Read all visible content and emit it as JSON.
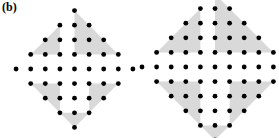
{
  "panel": {
    "label": "(b)",
    "caption_present": true
  },
  "style": {
    "background_color": "#ffffff",
    "dot_color": "#000000",
    "shade_color": "#d9d9d9",
    "dot_radius": 2.4
  },
  "chart_data": {
    "type": "scatter",
    "title": "(b)",
    "xlabel": "",
    "ylabel": "",
    "grid": false,
    "legend": null,
    "figures": [
      {
        "name": "left-diamond",
        "order": 4,
        "center": [
          74.5,
          69
        ],
        "spacing": 14.6,
        "center_row_count": 9,
        "total_dots": 41,
        "points": [
          [
            0,
            4
          ],
          [
            -1,
            3
          ],
          [
            0,
            3
          ],
          [
            1,
            3
          ],
          [
            -2,
            2
          ],
          [
            -1,
            2
          ],
          [
            0,
            2
          ],
          [
            1,
            2
          ],
          [
            2,
            2
          ],
          [
            -3,
            1
          ],
          [
            -2,
            1
          ],
          [
            -1,
            1
          ],
          [
            0,
            1
          ],
          [
            1,
            1
          ],
          [
            2,
            1
          ],
          [
            3,
            1
          ],
          [
            -4,
            0
          ],
          [
            -3,
            0
          ],
          [
            -2,
            0
          ],
          [
            -1,
            0
          ],
          [
            0,
            0
          ],
          [
            1,
            0
          ],
          [
            2,
            0
          ],
          [
            3,
            0
          ],
          [
            4,
            0
          ],
          [
            -3,
            -1
          ],
          [
            -2,
            -1
          ],
          [
            -1,
            -1
          ],
          [
            0,
            -1
          ],
          [
            1,
            -1
          ],
          [
            2,
            -1
          ],
          [
            3,
            -1
          ],
          [
            -2,
            -2
          ],
          [
            -1,
            -2
          ],
          [
            0,
            -2
          ],
          [
            1,
            -2
          ],
          [
            2,
            -2
          ],
          [
            -1,
            -3
          ],
          [
            0,
            -3
          ],
          [
            1,
            -3
          ],
          [
            0,
            -4
          ]
        ],
        "shaded_triangles": [
          {
            "id": "upper-right",
            "vertices": [
              [
                0,
                4
              ],
              [
                0,
                1
              ],
              [
                3,
                1
              ]
            ]
          },
          {
            "id": "upper-left",
            "vertices": [
              [
                -1,
                3
              ],
              [
                -3,
                1
              ],
              [
                -1,
                1
              ]
            ]
          },
          {
            "id": "lower-left",
            "vertices": [
              [
                -3,
                -1
              ],
              [
                -1,
                -1
              ],
              [
                -1,
                -3
              ]
            ]
          },
          {
            "id": "lower-right",
            "vertices": [
              [
                1,
                -1
              ],
              [
                3,
                -1
              ],
              [
                1,
                -3
              ]
            ]
          },
          {
            "id": "bottom-tip",
            "vertices": [
              [
                -1,
                -3
              ],
              [
                1,
                -3
              ],
              [
                0,
                -4
              ]
            ]
          }
        ]
      },
      {
        "name": "right-diamond",
        "order": 5,
        "center": [
          215,
          67
        ],
        "spacing": 14.6,
        "center_row_count": 10,
        "total_dots": 61,
        "points": [
          [
            0,
            5
          ],
          [
            -1,
            4
          ],
          [
            0,
            4
          ],
          [
            1,
            4
          ],
          [
            -2,
            3
          ],
          [
            -1,
            3
          ],
          [
            0,
            3
          ],
          [
            1,
            3
          ],
          [
            2,
            3
          ],
          [
            -3,
            2
          ],
          [
            -2,
            2
          ],
          [
            -1,
            2
          ],
          [
            0,
            2
          ],
          [
            1,
            2
          ],
          [
            2,
            2
          ],
          [
            3,
            2
          ],
          [
            -4,
            1
          ],
          [
            -3,
            1
          ],
          [
            -2,
            1
          ],
          [
            -1,
            1
          ],
          [
            0,
            1
          ],
          [
            1,
            1
          ],
          [
            2,
            1
          ],
          [
            3,
            1
          ],
          [
            4,
            1
          ],
          [
            -5,
            0
          ],
          [
            -4,
            0
          ],
          [
            -3,
            0
          ],
          [
            -2,
            0
          ],
          [
            -1,
            0
          ],
          [
            0,
            0
          ],
          [
            1,
            0
          ],
          [
            2,
            0
          ],
          [
            3,
            0
          ],
          [
            4,
            0
          ],
          [
            5,
            0
          ],
          [
            -4,
            -1
          ],
          [
            -3,
            -1
          ],
          [
            -2,
            -1
          ],
          [
            -1,
            -1
          ],
          [
            0,
            -1
          ],
          [
            1,
            -1
          ],
          [
            2,
            -1
          ],
          [
            3,
            -1
          ],
          [
            4,
            -1
          ],
          [
            -3,
            -2
          ],
          [
            -2,
            -2
          ],
          [
            -1,
            -2
          ],
          [
            0,
            -2
          ],
          [
            1,
            -2
          ],
          [
            2,
            -2
          ],
          [
            3,
            -2
          ],
          [
            -2,
            -3
          ],
          [
            -1,
            -3
          ],
          [
            0,
            -3
          ],
          [
            1,
            -3
          ],
          [
            2,
            -3
          ],
          [
            -1,
            -4
          ],
          [
            0,
            -4
          ],
          [
            1,
            -4
          ],
          [
            0,
            -5
          ]
        ],
        "shaded_triangles": [
          {
            "id": "upper-right",
            "vertices": [
              [
                0,
                5
              ],
              [
                0,
                1
              ],
              [
                4,
                1
              ]
            ]
          },
          {
            "id": "upper-left",
            "vertices": [
              [
                -1,
                4
              ],
              [
                -4,
                1
              ],
              [
                -1,
                1
              ]
            ]
          },
          {
            "id": "lower-left",
            "vertices": [
              [
                -4,
                -1
              ],
              [
                -1,
                -1
              ],
              [
                -1,
                -4
              ]
            ]
          },
          {
            "id": "lower-right",
            "vertices": [
              [
                1,
                -1
              ],
              [
                4,
                -1
              ],
              [
                1,
                -4
              ]
            ]
          },
          {
            "id": "bottom-tip",
            "vertices": [
              [
                -1,
                -4
              ],
              [
                1,
                -4
              ],
              [
                0,
                -5
              ]
            ]
          }
        ]
      }
    ]
  }
}
